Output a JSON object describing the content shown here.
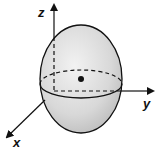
{
  "diagram": {
    "type": "ellipsoid-3d-axes",
    "axes": {
      "z_label": "z",
      "y_label": "y",
      "x_label": "x"
    },
    "colors": {
      "fill": "#d4d4d4",
      "stroke": "#111111",
      "background": "#ffffff"
    },
    "elements": [
      "ellipsoid",
      "equator-front-solid",
      "equator-back-dashed",
      "center-point",
      "z-axis",
      "y-axis",
      "x-axis"
    ]
  }
}
